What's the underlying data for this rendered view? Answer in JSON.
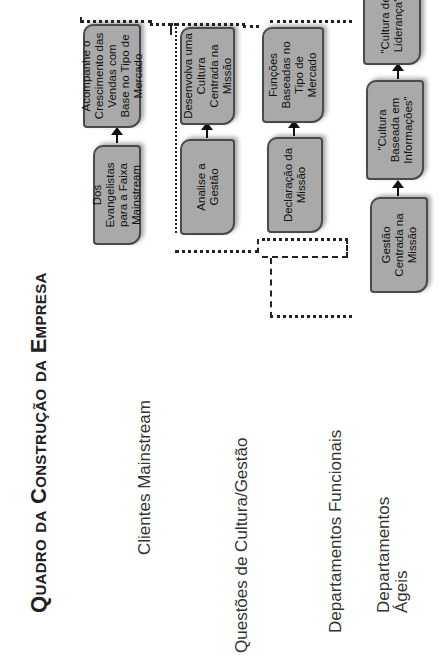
{
  "title": "Quadro da Construção da Empresa",
  "colors": {
    "box_fill": "#a9a9a9",
    "box_border": "#4a4a4a",
    "text": "#222222",
    "background": "#ffffff"
  },
  "rows": [
    {
      "label": "Clientes Mainstream",
      "boxes": [
        {
          "text": "Dos Evangelistas para a Faixa Mainstream"
        },
        {
          "text": "Acompanhe o Crescimento das Vendas com Base no Tipo de Mercado"
        }
      ]
    },
    {
      "label": "Questões de Cultura/Gestão",
      "boxes": [
        {
          "text": "Analise a Gestão"
        },
        {
          "text": "Desenvolva uma Cultura Centrada na Missão"
        }
      ]
    },
    {
      "label": "Departamentos Funcionais",
      "boxes": [
        {
          "text": "Declaração da Missão"
        },
        {
          "text": "Funções Baseadas no Tipo de Mercado"
        }
      ]
    },
    {
      "label_line1": "Departamentos",
      "label_line2": "Ágeis",
      "boxes": [
        {
          "text": "Gestão Centrada na Missão"
        },
        {
          "text": "\"Cultura Baseada em Informações\""
        },
        {
          "text": "\"Cultura de Liderança\""
        }
      ]
    }
  ],
  "orientation": "rotated -90deg"
}
